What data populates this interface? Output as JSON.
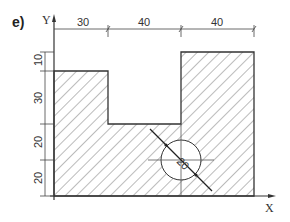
{
  "figure": {
    "part_label": "e)",
    "axis_x_label": "X",
    "axis_y_label": "Y",
    "top_dimensions": [
      "30",
      "40",
      "40"
    ],
    "left_dimensions": [
      "10",
      "30",
      "20",
      "20"
    ],
    "circle_label": "20",
    "line_color": "#333333",
    "hatch_color": "#555555"
  }
}
